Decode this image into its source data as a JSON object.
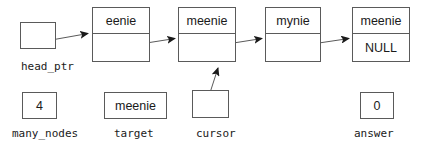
{
  "diagram": {
    "stroke_color": "#5a5a5a",
    "text_color": "#1a1a1a",
    "background": "#ffffff"
  },
  "list_nodes": [
    {
      "data": "eenie",
      "link": ""
    },
    {
      "data": "meenie",
      "link": ""
    },
    {
      "data": "mynie",
      "link": ""
    },
    {
      "data": "meenie",
      "link": "NULL"
    }
  ],
  "variables": [
    {
      "name": "head_ptr",
      "value": ""
    },
    {
      "name": "many_nodes",
      "value": "4"
    },
    {
      "name": "target",
      "value": "meenie"
    },
    {
      "name": "cursor",
      "value": ""
    },
    {
      "name": "answer",
      "value": "0"
    }
  ],
  "pointer_arrows": [
    {
      "from": "head_ptr",
      "to": "node-1"
    },
    {
      "from": "node-1",
      "to": "node-2"
    },
    {
      "from": "node-2",
      "to": "node-3"
    },
    {
      "from": "node-3",
      "to": "node-4"
    },
    {
      "from": "cursor",
      "to": "node-2"
    }
  ]
}
